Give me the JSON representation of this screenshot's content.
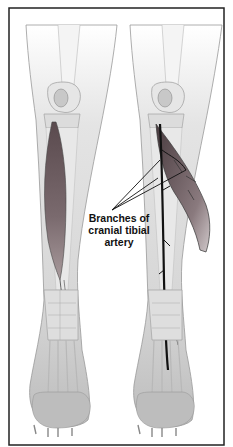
{
  "figure": {
    "panels": [
      {
        "name": "left-limb",
        "description": "Cranial tibial muscle in situ"
      },
      {
        "name": "right-limb",
        "description": "Muscle reflected exposing cranial tibial artery"
      }
    ],
    "annotation": {
      "line1": "Branches of",
      "line2": "cranial tibial",
      "line3": "artery"
    },
    "colors": {
      "border": "#222222",
      "skin": "#d8d8d8",
      "bone": "#e8e8e8",
      "muscle": "#6a5a5e",
      "artery": "#111111",
      "paw": "#bdbdbd"
    }
  }
}
